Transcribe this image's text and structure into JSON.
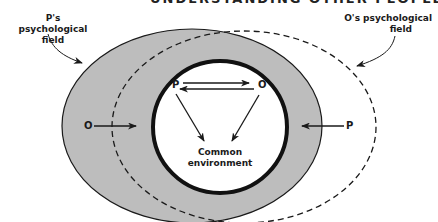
{
  "header": {
    "text": "UNDERSTANDING OTHER PEOPLE    255"
  },
  "labels": {
    "p_field_line1": "P's psychological",
    "p_field_line2": "field",
    "o_field_line1": "O's psychological",
    "o_field_line2": "field",
    "common_line1": "Common",
    "common_line2": "environment"
  },
  "letters": {
    "inner_p": "P",
    "inner_o": "O",
    "left_o": "O",
    "right_p": "P"
  },
  "colors": {
    "p_field_fill": "#bdbdbd",
    "stroke": "#1a1a1a",
    "background": "#ffffff"
  }
}
